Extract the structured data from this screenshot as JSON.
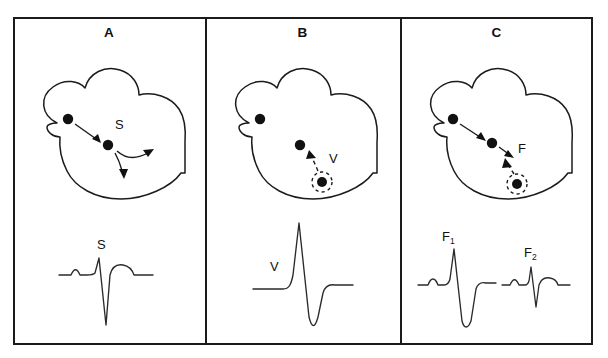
{
  "figure": {
    "background_color": "#ffffff",
    "line_color": "#1b1b1b",
    "panel_count": 3
  },
  "panels": [
    {
      "letter": "A",
      "name": "sinus-beat",
      "heart": {
        "sa_node_label": "",
        "av_node_label": "",
        "impulse_label": "S",
        "has_ectopic_focus": false,
        "solid_arrows": 3,
        "dashed_arrows": 0
      },
      "ecg": [
        {
          "label": "S",
          "name": "sinus-complex",
          "morphology": "p-wave, narrow deep QS, t-wave"
        }
      ]
    },
    {
      "letter": "B",
      "name": "ventricular-ectopic-beat",
      "heart": {
        "sa_node_label": "",
        "av_node_label": "",
        "impulse_label": "V",
        "has_ectopic_focus": true,
        "solid_arrows": 0,
        "dashed_arrows": 1
      },
      "ecg": [
        {
          "label": "V",
          "name": "ventricular-complex",
          "morphology": "no p-wave, tall wide R, deep wide S"
        }
      ]
    },
    {
      "letter": "C",
      "name": "fusion-beat",
      "heart": {
        "sa_node_label": "",
        "av_node_label": "",
        "impulse_label": "F",
        "has_ectopic_focus": true,
        "solid_arrows": 2,
        "dashed_arrows": 1
      },
      "ecg": [
        {
          "label": "F",
          "sub": "1",
          "name": "fusion-complex-1",
          "morphology": "p-wave, tall R, deep S, intermediate"
        },
        {
          "label": "F",
          "sub": "2",
          "name": "fusion-complex-2",
          "morphology": "p-wave, small narrow rS, near-sinus"
        }
      ]
    }
  ]
}
